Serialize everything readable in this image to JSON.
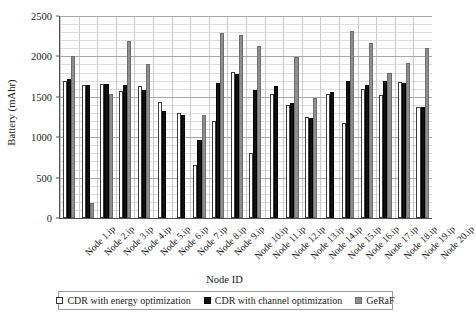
{
  "chart_data": {
    "type": "bar",
    "title": "",
    "xlabel": "Node ID",
    "ylabel": "Battery (mAhr)",
    "ylim": [
      0,
      2500
    ],
    "yticks": [
      0,
      500,
      1000,
      1500,
      2000,
      2500
    ],
    "grid": true,
    "legend_position": "bottom",
    "categories": [
      "Node 1.ip",
      "Node 2.ip",
      "Node 3.ip",
      "Node 4.ip",
      "Node 5.ip",
      "Node 6.ip",
      "Node 7.ip",
      "Node 8.ip",
      "Node 9.ip",
      "Node 10.ip",
      "Node 11.ip",
      "Node 12.ip",
      "Node 13.ip",
      "Node 14.ip",
      "Node 15.ip",
      "Node 16.ip",
      "Node 17.ip",
      "Node 18.ip",
      "Node 19.ip",
      "Node 20.ip"
    ],
    "series": [
      {
        "name": "CDR with energy optimization",
        "color": "#ffffff",
        "values": [
          1690,
          1650,
          1660,
          1570,
          1630,
          1440,
          1300,
          660,
          1200,
          1810,
          810,
          1540,
          1400,
          1250,
          1530,
          1170,
          1600,
          1520,
          1680,
          1370
        ]
      },
      {
        "name": "CDR with channel optimization",
        "color": "#111111",
        "values": [
          1720,
          1650,
          1655,
          1650,
          1580,
          1320,
          1270,
          970,
          1670,
          1780,
          1590,
          1640,
          1420,
          1240,
          1560,
          1690,
          1650,
          1700,
          1670,
          1370
        ]
      },
      {
        "name": "GeRaF",
        "color": "#8f8f8f",
        "values": [
          2000,
          180,
          1540,
          2190,
          1900,
          0,
          0,
          1280,
          2290,
          2270,
          2130,
          0,
          1990,
          1480,
          0,
          2320,
          2160,
          1790,
          1920,
          2110
        ]
      }
    ]
  }
}
